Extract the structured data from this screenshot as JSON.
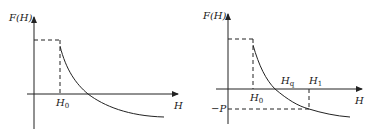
{
  "diagrams": [
    {
      "id": "left",
      "y_label": "F(H)",
      "x_label": "H",
      "points": [
        {
          "label": "H",
          "sub": "0"
        }
      ],
      "description": "Step at F max up to H0, then decaying curve crossing zero and becoming negative"
    },
    {
      "id": "right",
      "y_label": "F(H)",
      "x_label": "H",
      "points": [
        {
          "label": "H",
          "sub": "0"
        },
        {
          "label": "H",
          "sub": "q"
        },
        {
          "label": "H",
          "sub": "1"
        }
      ],
      "neg_label": "−P",
      "description": "Same curve with zero crossing Hq and point H1 where F(H1) = -P"
    }
  ],
  "colors": {
    "line": "#222222",
    "background": "#ffffff"
  }
}
